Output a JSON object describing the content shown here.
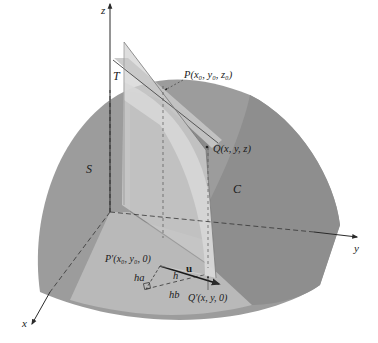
{
  "figure": {
    "colors": {
      "background": "#ffffff",
      "surface_dark": "#8f8f8f",
      "surface_mid": "#a3a3a3",
      "surface_light": "#b8b8b8",
      "floor": "#c4c4c4",
      "vertical_plane": "#d6d6d6",
      "tangent_plane": "#c9c9c9",
      "axis": "#2a2a2a"
    },
    "axes": {
      "x": "x",
      "y": "y",
      "z": "z"
    },
    "labels": {
      "surface": "S",
      "tangent_plane": "T",
      "curve": "C",
      "point_P": "P(x₀, y₀, z₀)",
      "point_Q": "Q(x, y, z)",
      "point_P_prime": "P′(x₀, y₀, 0)",
      "point_Q_prime": "Q′(x, y, 0)",
      "vector_u": "u",
      "seg_ha": "ha",
      "seg_h": "h",
      "seg_hb": "hb"
    }
  }
}
